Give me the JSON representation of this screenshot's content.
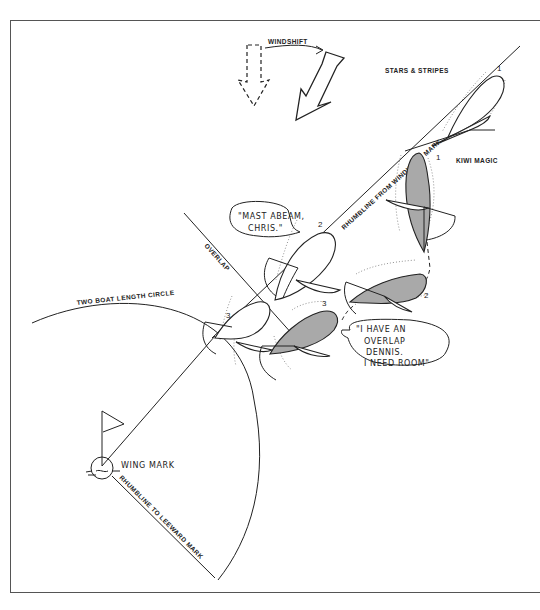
{
  "diagram": {
    "type": "sailing rules illustration - overlap at two boat length circle",
    "windshift": {
      "label": "WINDSHIFT"
    },
    "boats": {
      "stars_and_stripes": {
        "name": "STARS & STRIPES",
        "hull_color": "#ffffff",
        "positions": [
          "1",
          "2",
          "3"
        ]
      },
      "kiwi_magic": {
        "name": "KIWI MAGIC",
        "hull_color": "#a9a9a9",
        "positions": [
          "1",
          "2",
          "3"
        ]
      }
    },
    "speech": {
      "stars_and_stripes": "\"MAST ABEAM, CHRIS.\"",
      "stars_line1": "\"MAST ABEAM,",
      "stars_line2": "CHRIS.\"",
      "kiwi_line1": "\"I HAVE AN",
      "kiwi_line2": "OVERLAP",
      "kiwi_line3": "DENNIS.",
      "kiwi_line4": "I NEED ROOM\""
    },
    "labels": {
      "overlap": "OVERLAP",
      "circle": "TWO BOAT LENGTH CIRCLE",
      "mark": "WING MARK",
      "rhumb_windward": "RHUMBLINE FROM WINDWARD MARK",
      "rhumb_leeward": "RHUMBLINE TO LEEWARD MARK"
    },
    "colors": {
      "ink": "#222222",
      "shaded_hull": "#a9a9a9",
      "background": "#ffffff",
      "frame": "#555555"
    }
  }
}
